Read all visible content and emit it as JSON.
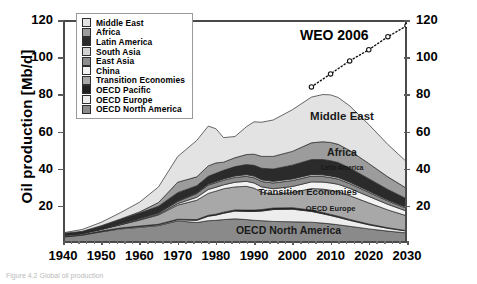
{
  "figure": {
    "caption": "Figure 4.2   Global oil production",
    "weo_annotation": "WEO 2006"
  },
  "axes": {
    "ylabel": "Oil production [Mb/d]",
    "xlabel": "",
    "yticks": [
      0,
      20,
      40,
      60,
      80,
      100,
      120
    ],
    "ytick_labels": [
      "",
      "20",
      "40",
      "60",
      "80",
      "100",
      "120"
    ],
    "xticks": [
      1940,
      1950,
      1960,
      1970,
      1980,
      1990,
      2000,
      2010,
      2020,
      2030
    ],
    "xtick_labels": [
      "1940",
      "1950",
      "1960",
      "1970",
      "1980",
      "1990",
      "2000",
      "2010",
      "2020",
      "2030"
    ],
    "ylim": [
      0,
      120
    ],
    "xlim": [
      1940,
      2030
    ],
    "right_axis_labels": [
      "20",
      "40",
      "60",
      "80",
      "100",
      "120"
    ]
  },
  "legend": {
    "position": "top-left-inside",
    "items": [
      {
        "label": "Middle East",
        "color": "#e3e3e3"
      },
      {
        "label": "Africa",
        "color": "#9c9c9c"
      },
      {
        "label": "Latin America",
        "color": "#2b2b2b"
      },
      {
        "label": "South Asia",
        "color": "#d2d2d2"
      },
      {
        "label": "East Asia",
        "color": "#8d8d8d"
      },
      {
        "label": "China",
        "color": "#f2f2f2"
      },
      {
        "label": "Transition Economies",
        "color": "#a8a8a8"
      },
      {
        "label": "OECD Pacific",
        "color": "#1f1f1f"
      },
      {
        "label": "OECD Europe",
        "color": "#ededed"
      },
      {
        "label": "OECD North America",
        "color": "#8a8a8a"
      }
    ]
  },
  "band_labels": [
    {
      "text": "Middle East",
      "x": 2013,
      "y": 68,
      "size": 11.5
    },
    {
      "text": "Africa",
      "x": 2013,
      "y": 49,
      "size": 10.5
    },
    {
      "text": "Latin America",
      "x": 2013,
      "y": 40,
      "size": 6.5
    },
    {
      "text": "Transition Economies",
      "x": 2004,
      "y": 27.5,
      "size": 9.5
    },
    {
      "text": "OECD Europe",
      "x": 2010,
      "y": 18.5,
      "size": 7.5
    },
    {
      "text": "OECD North America",
      "x": 1999,
      "y": 7,
      "size": 10.5
    }
  ],
  "chart_data": {
    "type": "area",
    "title": "Global oil production",
    "xlabel": "",
    "ylabel": "Oil production [Mb/d]",
    "xlim": [
      1940,
      2030
    ],
    "ylim": [
      0,
      120
    ],
    "grid": false,
    "stacked": true,
    "legend_position": "upper left",
    "x": [
      1940,
      1945,
      1950,
      1955,
      1960,
      1965,
      1970,
      1975,
      1978,
      1980,
      1982,
      1985,
      1988,
      1990,
      1992,
      1995,
      2000,
      2005,
      2008,
      2010,
      2012,
      2015,
      2020,
      2025,
      2030
    ],
    "series": [
      {
        "name": "OECD North America",
        "color": "#8a8a8a",
        "values": [
          3.2,
          4.2,
          6.0,
          7.6,
          8.4,
          9.4,
          11.9,
          11.0,
          12.0,
          12.2,
          12.6,
          13.0,
          12.6,
          12.2,
          12.0,
          11.6,
          11.4,
          11.2,
          10.7,
          10.3,
          9.8,
          9.0,
          7.6,
          6.4,
          5.4
        ]
      },
      {
        "name": "OECD Europe",
        "color": "#ededed",
        "values": [
          0.2,
          0.2,
          0.3,
          0.4,
          0.5,
          0.5,
          0.6,
          1.2,
          2.4,
          2.8,
          3.4,
          4.2,
          4.4,
          4.8,
          5.2,
          6.4,
          6.8,
          5.8,
          5.0,
          4.5,
          4.0,
          3.2,
          2.2,
          1.5,
          1.0
        ]
      },
      {
        "name": "OECD Pacific",
        "color": "#1f1f1f",
        "values": [
          0.1,
          0.1,
          0.1,
          0.1,
          0.2,
          0.2,
          0.3,
          0.4,
          0.5,
          0.5,
          0.6,
          0.6,
          0.7,
          0.7,
          0.8,
          0.8,
          0.8,
          0.7,
          0.7,
          0.6,
          0.6,
          0.5,
          0.4,
          0.3,
          0.2
        ]
      },
      {
        "name": "Transition Economies",
        "color": "#a8a8a8",
        "values": [
          0.6,
          0.6,
          0.9,
          1.7,
          3.2,
          5.0,
          7.6,
          10.4,
          11.8,
          12.4,
          12.6,
          12.4,
          12.8,
          11.8,
          9.4,
          7.4,
          8.2,
          11.6,
          12.6,
          13.0,
          13.2,
          12.8,
          11.4,
          9.6,
          8.0
        ]
      },
      {
        "name": "China",
        "color": "#f2f2f2",
        "values": [
          0.02,
          0.02,
          0.05,
          0.1,
          0.2,
          0.4,
          0.8,
          1.6,
          2.1,
          2.1,
          2.1,
          2.5,
          2.7,
          2.8,
          2.8,
          3.0,
          3.2,
          3.6,
          3.8,
          3.9,
          4.0,
          3.9,
          3.5,
          3.0,
          2.5
        ]
      },
      {
        "name": "East Asia",
        "color": "#8d8d8d",
        "values": [
          0.3,
          0.1,
          0.3,
          0.5,
          0.6,
          0.7,
          1.2,
          2.0,
          2.4,
          2.5,
          2.5,
          2.6,
          2.7,
          2.8,
          2.9,
          3.1,
          3.2,
          3.1,
          3.0,
          2.9,
          2.8,
          2.6,
          2.2,
          1.8,
          1.5
        ]
      },
      {
        "name": "South Asia",
        "color": "#d2d2d2",
        "values": [
          0.05,
          0.05,
          0.08,
          0.1,
          0.2,
          0.2,
          0.3,
          0.4,
          0.5,
          0.6,
          0.7,
          0.8,
          0.9,
          0.9,
          0.9,
          0.9,
          0.9,
          0.9,
          0.9,
          0.9,
          0.9,
          0.8,
          0.7,
          0.6,
          0.5
        ]
      },
      {
        "name": "Latin America",
        "color": "#2b2b2b",
        "values": [
          0.6,
          0.9,
          1.4,
          2.1,
          2.8,
          3.4,
          4.4,
          3.8,
          4.2,
          4.4,
          4.6,
          5.0,
          5.4,
          5.8,
          6.2,
          6.6,
          7.4,
          8.0,
          8.2,
          8.2,
          8.0,
          7.6,
          6.6,
          5.6,
          4.6
        ]
      },
      {
        "name": "Africa",
        "color": "#9c9c9c",
        "values": [
          0.1,
          0.1,
          0.2,
          0.3,
          0.6,
          2.0,
          5.6,
          4.8,
          5.6,
          5.6,
          4.4,
          4.8,
          5.4,
          6.0,
          6.4,
          6.8,
          7.4,
          9.0,
          9.6,
          9.8,
          9.8,
          9.4,
          8.2,
          6.8,
          5.6
        ]
      },
      {
        "name": "Middle East",
        "color": "#e3e3e3",
        "values": [
          0.3,
          1.0,
          1.8,
          3.4,
          5.2,
          8.4,
          13.8,
          19.6,
          21.4,
          18.4,
          13.2,
          11.4,
          15.0,
          17.4,
          18.4,
          19.6,
          22.4,
          24.6,
          25.4,
          25.6,
          25.2,
          24.0,
          21.0,
          17.4,
          14.2
        ]
      }
    ],
    "annotation_line": {
      "name": "WEO 2006",
      "style": "dotted-with-circle-markers",
      "x": [
        2005,
        2010,
        2015,
        2020,
        2025,
        2030
      ],
      "y": [
        84,
        91,
        98,
        104,
        111,
        117
      ]
    }
  }
}
